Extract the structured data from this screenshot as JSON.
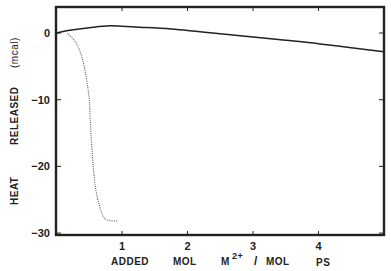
{
  "chart_data": {
    "type": "line",
    "title": "",
    "xlabel": "ADDED  MOL  M2+ / MOL  PS",
    "ylabel": "HEAT  RELEASED  (mcal)",
    "xlim": [
      0,
      5
    ],
    "ylim": [
      -30,
      4
    ],
    "grid": false,
    "legend": null,
    "x_ticks": [
      {
        "value": 1,
        "label": "1"
      },
      {
        "value": 2,
        "label": "2"
      },
      {
        "value": 3,
        "label": "3"
      },
      {
        "value": 4,
        "label": "4"
      }
    ],
    "y_ticks": [
      {
        "value": 0,
        "label": "0"
      },
      {
        "value": -10,
        "label": "-10"
      },
      {
        "value": -20,
        "label": "-20"
      },
      {
        "value": -30,
        "label": "-30"
      }
    ],
    "series": [
      {
        "name": "solid",
        "style": "solid",
        "x": [
          0.0,
          0.2,
          0.5,
          0.82,
          1.2,
          1.75,
          2.5,
          3.0,
          3.5,
          4.0,
          4.5,
          5.0
        ],
        "y": [
          0.0,
          0.4,
          0.8,
          1.1,
          0.9,
          0.6,
          -0.1,
          -0.6,
          -1.1,
          -1.6,
          -2.2,
          -2.8
        ]
      },
      {
        "name": "dotted",
        "style": "dotted",
        "x": [
          0.16,
          0.3,
          0.4,
          0.46,
          0.5,
          0.52,
          0.56,
          0.6,
          0.66,
          0.72,
          0.8,
          0.93
        ],
        "y": [
          0.0,
          -1.5,
          -4.0,
          -7.0,
          -10.0,
          -14.0,
          -20.0,
          -23.5,
          -26.0,
          -27.6,
          -28.1,
          -28.2
        ]
      }
    ]
  },
  "labels": {
    "y_words": [
      "HEAT",
      "RELEASED",
      "(mcal)"
    ],
    "x_words": [
      "ADDED",
      "MOL",
      "M",
      "2+",
      "/",
      "MOL",
      "PS"
    ]
  }
}
